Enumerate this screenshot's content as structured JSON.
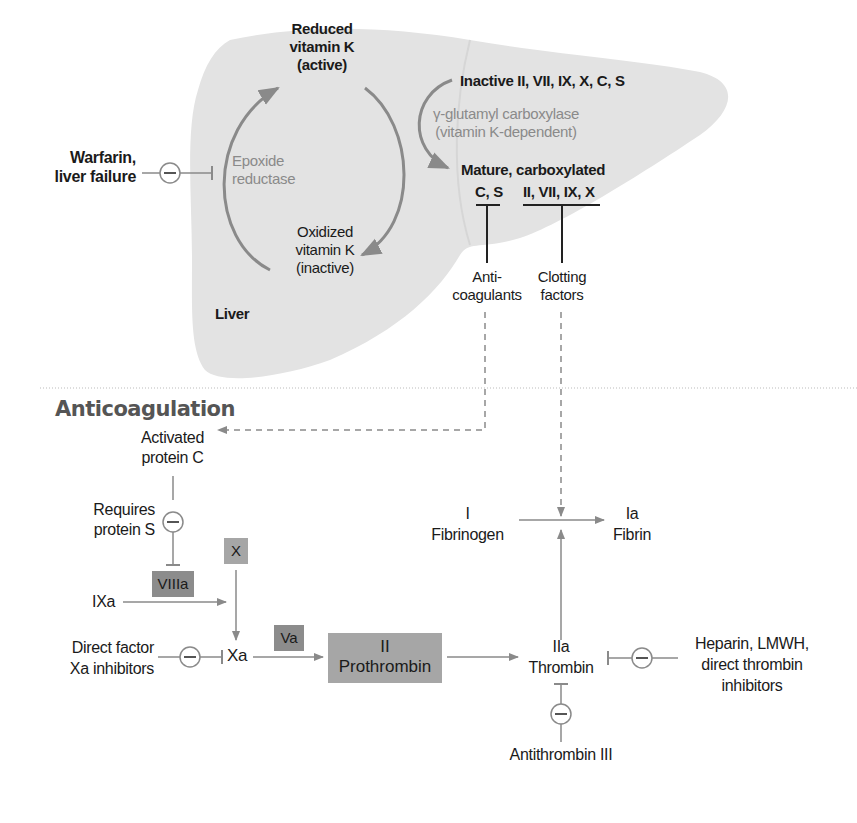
{
  "liver": {
    "organ_label": "Liver",
    "reduced_vitk": [
      "Reduced",
      "vitamin K",
      "(active)"
    ],
    "oxidized_vitk": [
      "Oxidized",
      "vitamin K",
      "(inactive)"
    ],
    "epoxide_reductase": [
      "Epoxide",
      "reductase"
    ],
    "warfarin": [
      "Warfarin,",
      "liver failure"
    ],
    "inactive_factors": "Inactive II, VII, IX, X, C, S",
    "carboxylase": [
      "γ-glutamyl carboxylase",
      "(vitamin K-dependent)"
    ],
    "mature": "Mature, carboxylated",
    "mature_cs": "C, S",
    "mature_clotting": "II, VII, IX, X",
    "anticoagulants": [
      "Anti-",
      "coagulants"
    ],
    "clotting_factors": [
      "Clotting",
      "factors"
    ]
  },
  "anticoagulation": {
    "title": "Anticoagulation",
    "activated_protein_c": [
      "Activated",
      "protein C"
    ],
    "requires_protein_s": [
      "Requires",
      "protein S"
    ],
    "factor_x": "X",
    "factor_viiia": "VIIIa",
    "factor_ixa": "IXa",
    "factor_xa": "Xa",
    "factor_va": "Va",
    "direct_xa_inhibitors": [
      "Direct factor",
      "Xa inhibitors"
    ],
    "prothrombin": [
      "II",
      "Prothrombin"
    ],
    "thrombin": [
      "IIa",
      "Thrombin"
    ],
    "fibrinogen": [
      "I",
      "Fibrinogen"
    ],
    "fibrin": [
      "Ia",
      "Fibrin"
    ],
    "heparin": [
      "Heparin, LMWH,",
      "direct thrombin",
      "inhibitors"
    ],
    "antithrombin": "Antithrombin III",
    "inhibit_symbol": "−"
  },
  "colors": {
    "liver_fill": "#e3e3e3",
    "arrow_grey": "#8a8a8a",
    "box_light": "#a6a6a6",
    "box_dark": "#8c8c8c",
    "title_grey": "#555555"
  }
}
